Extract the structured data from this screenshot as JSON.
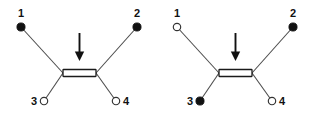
{
  "figure": {
    "background_color": "#ffffff",
    "line_color": "#4d4d4d",
    "bond_color": "#1a1a1a",
    "filled_marker_color": "#111111",
    "open_marker_fill": "#ffffff",
    "label_color": "#111111",
    "arrow_color": "#111111",
    "structure_count": 2,
    "arrow_glyph": "downward-arrow"
  },
  "structures": [
    {
      "id": "structure-left",
      "name": "left-alkene",
      "central_bond": {
        "type": "double-bond",
        "orientation": "horizontal",
        "label": "C=C"
      },
      "arrow": {
        "direction": "down",
        "points_to": "central-double-bond"
      },
      "substituents": [
        {
          "position": "1",
          "label": "1",
          "marker": "filled",
          "corner": "top-left",
          "label_side": "above"
        },
        {
          "position": "2",
          "label": "2",
          "marker": "filled",
          "corner": "top-right",
          "label_side": "above"
        },
        {
          "position": "3",
          "label": "3",
          "marker": "open",
          "corner": "bottom-left",
          "label_side": "left"
        },
        {
          "position": "4",
          "label": "4",
          "marker": "open",
          "corner": "bottom-right",
          "label_side": "right"
        }
      ]
    },
    {
      "id": "structure-right",
      "name": "right-alkene",
      "central_bond": {
        "type": "double-bond",
        "orientation": "horizontal",
        "label": "C=C"
      },
      "arrow": {
        "direction": "down",
        "points_to": "central-double-bond"
      },
      "substituents": [
        {
          "position": "1",
          "label": "1",
          "marker": "open",
          "corner": "top-left",
          "label_side": "above"
        },
        {
          "position": "2",
          "label": "2",
          "marker": "filled",
          "corner": "top-right",
          "label_side": "above"
        },
        {
          "position": "3",
          "label": "3",
          "marker": "filled",
          "corner": "bottom-left",
          "label_side": "left"
        },
        {
          "position": "4",
          "label": "4",
          "marker": "open",
          "corner": "bottom-right",
          "label_side": "right"
        }
      ]
    }
  ]
}
